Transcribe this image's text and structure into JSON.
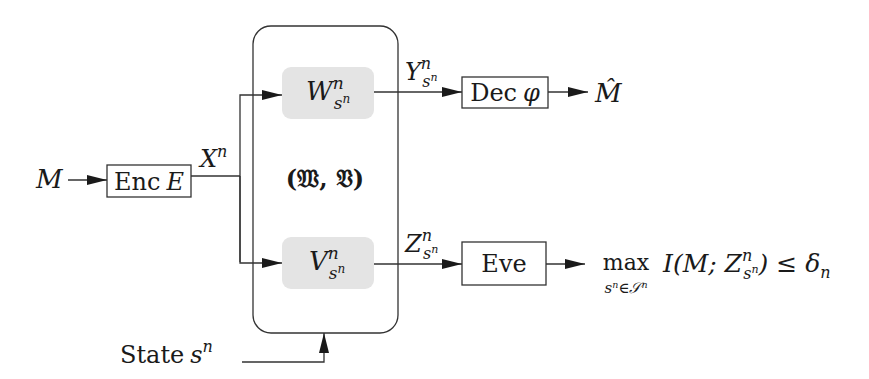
{
  "diagram": {
    "input": {
      "label": "M"
    },
    "encoder": {
      "label": "Enc",
      "symbol": "E"
    },
    "encoder_output": {
      "label": "X",
      "sup": "n"
    },
    "channel_pair": {
      "label": "(𝔚, 𝔙)"
    },
    "legit_channel": {
      "label": "W",
      "sup": "n",
      "sub": "s",
      "subsup": "n"
    },
    "eve_channel": {
      "label": "V",
      "sup": "n",
      "sub": "s",
      "subsup": "n"
    },
    "legit_output": {
      "label": "Y",
      "sup": "n",
      "sub": "s",
      "subsup": "n"
    },
    "eve_output": {
      "label": "Z",
      "sup": "n",
      "sub": "s",
      "subsup": "n"
    },
    "decoder": {
      "label": "Dec",
      "symbol": "φ"
    },
    "decoder_output": {
      "label": "M̂"
    },
    "eavesdropper": {
      "label": "Eve"
    },
    "secrecy_constraint": {
      "operator": "max",
      "operator_sub": "sⁿ∈𝒮ⁿ",
      "expr_prefix": "I(M; Z",
      "expr_sup": "n",
      "expr_sub": "s",
      "expr_subsup": "n",
      "expr_suffix": ") ≤ δ",
      "delta_sub": "n"
    },
    "state": {
      "label": "State",
      "symbol": "s",
      "sup": "n"
    },
    "colors": {
      "stroke": "#333333",
      "channel_fill": "#e4e4e4",
      "text": "#1a1a1a"
    }
  }
}
